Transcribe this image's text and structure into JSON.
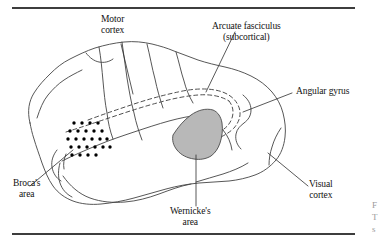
{
  "figure": {
    "top_rule": true,
    "bottom_rule": true
  },
  "labels": {
    "motor_cortex": {
      "line1": "Motor",
      "line2": "cortex"
    },
    "arcuate": {
      "line1": "Arcuate fasciculus",
      "line2": "(subcortical)"
    },
    "angular_gyrus": {
      "line1": "Angular gyrus",
      "line2": ""
    },
    "visual_cortex": {
      "line1": "Visual",
      "line2": "cortex"
    },
    "wernicke": {
      "line1": "Wernicke's",
      "line2": "area"
    },
    "broca": {
      "line1": "Broca's",
      "line2": "area"
    }
  },
  "caption_fragments": {
    "line1": "F",
    "line2": "T",
    "line3": "s"
  },
  "colors": {
    "ink": "#111111",
    "outline": "#444444",
    "rule": "#3d3d3d",
    "shaded_area_fill": "#b8b8b8",
    "shaded_area_stroke": "#4a4a4a",
    "dot": "#000000",
    "caption_grey": "#9a9a9a"
  },
  "graphics": {
    "broca_dot_grid": {
      "description": "stippled dot field marking Broca's area",
      "rows": [
        4,
        5,
        6,
        6,
        4
      ],
      "dot_radius_px": 1.7
    },
    "wernicke_shaded_region": {
      "description": "grey filled wedge marking Wernicke's area",
      "fill": "#b8b8b8"
    },
    "arcuate_fasciculus_path": {
      "description": "dashed subcortical loop connecting Broca's and Wernicke's areas",
      "style": "dashed"
    },
    "leader_lines": 6
  }
}
